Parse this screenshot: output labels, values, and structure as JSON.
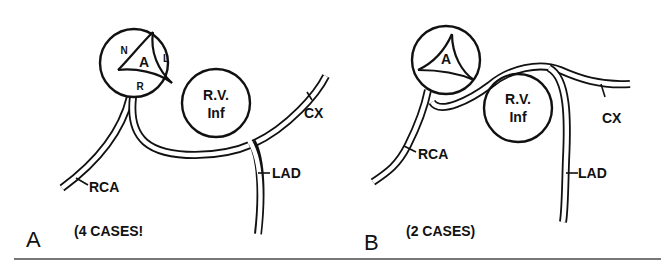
{
  "figure": {
    "panels": [
      {
        "id": "A",
        "letter": "A",
        "caption": "(4 CASES!",
        "aortic_valve_label": "A",
        "cusp_labels": {
          "noncoronary": "N",
          "left": "L",
          "right": "R"
        },
        "rv_label_line1": "R.V.",
        "rv_label_line2": "Inf",
        "vessel_labels": {
          "rca": "RCA",
          "lad": "LAD",
          "cx": "CX"
        }
      },
      {
        "id": "B",
        "letter": "B",
        "caption": "(2 CASES)",
        "aortic_valve_label": "A",
        "rv_label_line1": "R.V.",
        "rv_label_line2": "Inf",
        "vessel_labels": {
          "rca": "RCA",
          "lad": "LAD",
          "cx": "CX"
        }
      }
    ],
    "colors": {
      "ink": "#111111",
      "background": "#ffffff",
      "rule": "#777777"
    }
  }
}
